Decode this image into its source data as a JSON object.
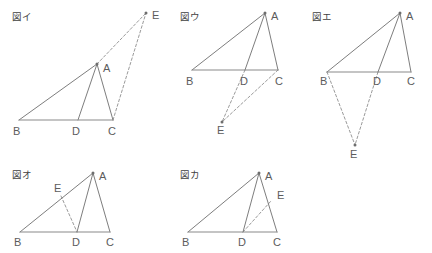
{
  "page": {
    "background_color": "#ffffff",
    "line_color": "#6e6e6e",
    "label_color": "#5c5c5c",
    "width": 432,
    "height": 253
  },
  "panels": [
    {
      "id": "panel-i",
      "caption": "図イ",
      "caption_x": 12,
      "caption_y": 20,
      "points": {
        "A": {
          "x": 97,
          "y": 64,
          "label": "A",
          "label_x": 103,
          "label_y": 72
        },
        "B": {
          "x": 19,
          "y": 120,
          "label": "B",
          "label_x": 13,
          "label_y": 135
        },
        "C": {
          "x": 113,
          "y": 120,
          "label": "C",
          "label_x": 108,
          "label_y": 135
        },
        "D": {
          "x": 78,
          "y": 120,
          "label": "D",
          "label_x": 72,
          "label_y": 135
        },
        "E": {
          "x": 146,
          "y": 13,
          "label": "E",
          "label_x": 152,
          "label_y": 19
        }
      },
      "solid_edges": [
        [
          "B",
          "A"
        ],
        [
          "A",
          "C"
        ],
        [
          "A",
          "D"
        ]
      ],
      "base_edges": [
        [
          "B",
          "C"
        ]
      ],
      "dashed_edges": [
        [
          "A",
          "E"
        ],
        [
          "C",
          "E"
        ]
      ],
      "dots": [
        "A",
        "E"
      ]
    },
    {
      "id": "panel-u",
      "caption": "図ウ",
      "caption_x": 180,
      "caption_y": 20,
      "points": {
        "A": {
          "x": 265,
          "y": 13,
          "label": "A",
          "label_x": 271,
          "label_y": 20
        },
        "B": {
          "x": 192,
          "y": 70,
          "label": "B",
          "label_x": 186,
          "label_y": 85
        },
        "C": {
          "x": 278,
          "y": 70,
          "label": "C",
          "label_x": 275,
          "label_y": 85
        },
        "D": {
          "x": 245,
          "y": 70,
          "label": "D",
          "label_x": 240,
          "label_y": 85
        },
        "E": {
          "x": 222,
          "y": 122,
          "label": "E",
          "label_x": 217,
          "label_y": 134
        }
      },
      "solid_edges": [
        [
          "B",
          "A"
        ],
        [
          "A",
          "C"
        ],
        [
          "A",
          "D"
        ]
      ],
      "base_edges": [
        [
          "B",
          "C"
        ]
      ],
      "dashed_edges": [
        [
          "D",
          "E"
        ],
        [
          "C",
          "E"
        ]
      ],
      "dots": [
        "A",
        "E"
      ]
    },
    {
      "id": "panel-e",
      "caption": "図エ",
      "caption_x": 312,
      "caption_y": 20,
      "points": {
        "A": {
          "x": 400,
          "y": 13,
          "label": "A",
          "label_x": 406,
          "label_y": 20
        },
        "B": {
          "x": 327,
          "y": 72,
          "label": "B",
          "label_x": 320,
          "label_y": 85
        },
        "C": {
          "x": 411,
          "y": 72,
          "label": "C",
          "label_x": 407,
          "label_y": 85
        },
        "D": {
          "x": 378,
          "y": 72,
          "label": "D",
          "label_x": 373,
          "label_y": 85
        },
        "E": {
          "x": 355,
          "y": 145,
          "label": "E",
          "label_x": 350,
          "label_y": 158
        }
      },
      "solid_edges": [
        [
          "B",
          "A"
        ],
        [
          "A",
          "C"
        ],
        [
          "A",
          "D"
        ]
      ],
      "base_edges": [
        [
          "B",
          "C"
        ]
      ],
      "dashed_edges": [
        [
          "B",
          "E"
        ],
        [
          "D",
          "E"
        ]
      ],
      "dots": [
        "A",
        "E"
      ]
    },
    {
      "id": "panel-o",
      "caption": "図オ",
      "caption_x": 12,
      "caption_y": 178,
      "points": {
        "A": {
          "x": 93,
          "y": 173,
          "label": "A",
          "label_x": 99,
          "label_y": 180
        },
        "B": {
          "x": 20,
          "y": 232,
          "label": "B",
          "label_x": 14,
          "label_y": 246
        },
        "C": {
          "x": 110,
          "y": 232,
          "label": "C",
          "label_x": 106,
          "label_y": 246
        },
        "D": {
          "x": 77,
          "y": 232,
          "label": "D",
          "label_x": 72,
          "label_y": 246
        },
        "E": {
          "x": 61,
          "y": 196,
          "label": "E",
          "label_x": 54,
          "label_y": 192
        }
      },
      "solid_edges": [
        [
          "B",
          "A"
        ],
        [
          "A",
          "C"
        ],
        [
          "A",
          "D"
        ]
      ],
      "base_edges": [
        [
          "B",
          "C"
        ]
      ],
      "dashed_edges": [
        [
          "E",
          "D"
        ]
      ],
      "dots": [
        "A"
      ]
    },
    {
      "id": "panel-ka",
      "caption": "図カ",
      "caption_x": 180,
      "caption_y": 178,
      "points": {
        "A": {
          "x": 259,
          "y": 173,
          "label": "A",
          "label_x": 265,
          "label_y": 180
        },
        "B": {
          "x": 188,
          "y": 232,
          "label": "B",
          "label_x": 182,
          "label_y": 246
        },
        "C": {
          "x": 277,
          "y": 232,
          "label": "C",
          "label_x": 273,
          "label_y": 246
        },
        "D": {
          "x": 243,
          "y": 232,
          "label": "D",
          "label_x": 238,
          "label_y": 246
        },
        "E": {
          "x": 271,
          "y": 201,
          "label": "E",
          "label_x": 277,
          "label_y": 199
        }
      },
      "solid_edges": [
        [
          "B",
          "A"
        ],
        [
          "A",
          "C"
        ],
        [
          "A",
          "D"
        ]
      ],
      "base_edges": [
        [
          "B",
          "C"
        ]
      ],
      "dashed_edges": [
        [
          "D",
          "E"
        ]
      ],
      "dots": [
        "A"
      ]
    }
  ]
}
